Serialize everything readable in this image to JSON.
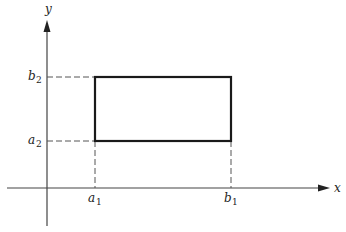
{
  "diagram": {
    "type": "rectangle-in-plane",
    "colors": {
      "axis": "#444444",
      "rect": "#1a1a1a",
      "dash": "#555555",
      "text": "#222222"
    },
    "axes": {
      "x": {
        "label": "x"
      },
      "y": {
        "label": "y"
      }
    },
    "ticks": {
      "a1": {
        "base": "a",
        "sub": "1"
      },
      "b1": {
        "base": "b",
        "sub": "1"
      },
      "a2": {
        "base": "a",
        "sub": "2"
      },
      "b2": {
        "base": "b",
        "sub": "2"
      }
    },
    "rectangle": {
      "x_from": "a1",
      "x_to": "b1",
      "y_from": "a2",
      "y_to": "b2"
    }
  }
}
